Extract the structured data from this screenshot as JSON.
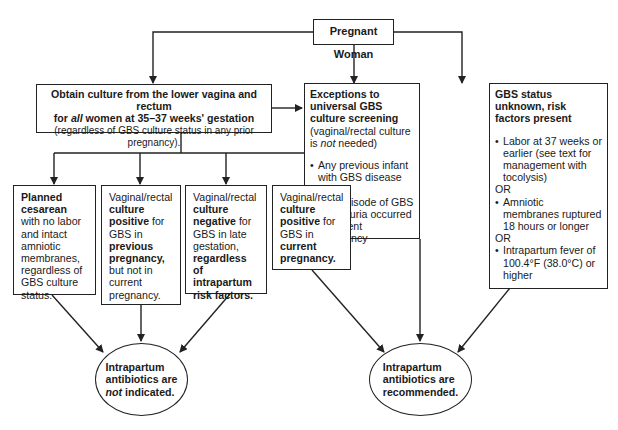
{
  "start": {
    "label": "Pregnant Woman"
  },
  "culture": {
    "line1": "Obtain culture from the lower vagina and rectum",
    "line2_pre": "for ",
    "line2_italic": "all",
    "line2_post": " women at 35–37 weeks' gestation",
    "line3": "(regardless of GBS culture status in any prior pregnancy)."
  },
  "exceptions": {
    "title": "Exceptions to universal GBS culture screening",
    "note_pre": "(vaginal/rectal culture is ",
    "note_italic": "not",
    "note_post": " needed)",
    "items": [
      "Any previous infant with GBS disease",
      "Any episode of GBS bacteriuria occurred in current pregnancy"
    ],
    "or": "OR"
  },
  "unknown": {
    "title": "GBS status unknown, risk factors present",
    "items": [
      "Labor at 37 weeks or earlier (see text for management with tocolysis)",
      "Amniotic membranes ruptured 18 hours or longer",
      "Intrapartum fever of 100.4°F (38.0°C) or higher"
    ],
    "or": "OR"
  },
  "branches": {
    "cesarean": {
      "b1": "Planned cesarean",
      "t1": " with no labor and intact amniotic membranes, regardless of GBS culture status."
    },
    "prev_positive": {
      "t1": "Vaginal/rectal ",
      "b1": "culture positive",
      "t2": " for GBS in ",
      "b2": "previous pregnancy,",
      "t3": " but not in current pregnancy."
    },
    "negative": {
      "t1": "Vaginal/rectal ",
      "b1": "culture negative",
      "t2": " for GBS in late gestation, ",
      "b2": "regardless of intrapartum risk factors."
    },
    "curr_positive": {
      "t1": "Vaginal/rectal ",
      "b1": "culture positive",
      "t2": " for GBS in ",
      "b2": "current pregnancy."
    }
  },
  "outcomes": {
    "not_indicated": {
      "l1": "Intrapartum",
      "l2": "antibiotics are",
      "l3_italic": "not",
      "l3_post": " indicated."
    },
    "recommended": {
      "l1": "Intrapartum",
      "l2": "antibiotics are",
      "l3": "recommended."
    }
  }
}
